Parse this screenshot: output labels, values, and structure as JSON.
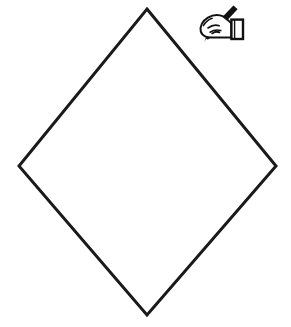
{
  "page": {
    "background_color": "#ffffff",
    "width": 291,
    "height": 327
  },
  "shape": {
    "name": "diamond-outline",
    "type": "rhombus",
    "label": "Blank diamond placard outline",
    "stroke_color": "#1a1a1a",
    "fill_color": "#ffffff",
    "stroke_width": 3,
    "vertices": {
      "top": {
        "x": 147,
        "y": 9
      },
      "right": {
        "x": 276,
        "y": 166
      },
      "bottom": {
        "x": 147,
        "y": 315
      },
      "left": {
        "x": 19,
        "y": 166
      }
    },
    "points_path": "147,9 276,166 147,315 19,166"
  },
  "icon": {
    "name": "hand-writing-pencil-icon",
    "label": "Hand holding a pencil",
    "color": "#111111",
    "position": {
      "x": 195,
      "y": 4,
      "width": 50,
      "height": 44
    }
  },
  "alt_text": {
    "shape": "Large empty diamond shape outlined in black",
    "icon": "Clipart of a hand holding a pencil, indicating write or draw here"
  }
}
